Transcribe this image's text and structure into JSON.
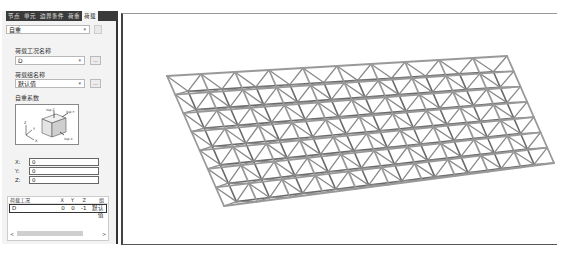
{
  "tabs": [
    {
      "label": "节点",
      "active": false
    },
    {
      "label": "单元",
      "active": false
    },
    {
      "label": "边界条件",
      "active": false
    },
    {
      "label": "荷重",
      "active": false
    },
    {
      "label": "荷载",
      "active": true
    }
  ],
  "load_type_select": {
    "value": "自重"
  },
  "load_case_name": {
    "label": "荷载工况名称",
    "value": "D",
    "button_label": "..."
  },
  "load_group_name": {
    "label": "荷载组名称",
    "value": "默认值",
    "button_label": "..."
  },
  "self_weight_factor": {
    "label": "自重系数",
    "diagram_labels": {
      "top": "Vsp.Z",
      "right": "Vsp.Y",
      "bottom": "Vsp.X",
      "axis_x": "X",
      "axis_y": "Y",
      "axis_z": "Z"
    }
  },
  "factors": [
    {
      "label": "X:",
      "value": "0"
    },
    {
      "label": "Y:",
      "value": "0"
    },
    {
      "label": "Z:",
      "value": "0"
    }
  ],
  "table": {
    "headers": [
      "荷载工况",
      "X",
      "Y",
      "Z",
      "组"
    ],
    "rows": [
      {
        "case": "D",
        "x": "0",
        "y": "0",
        "z": "-1",
        "group": "默认值"
      }
    ]
  },
  "scrollbar": {
    "left_arrow": "<",
    "right_arrow": ">"
  },
  "viewport": {
    "model": "space-truss-grid",
    "columns": 10,
    "rows": 7
  }
}
